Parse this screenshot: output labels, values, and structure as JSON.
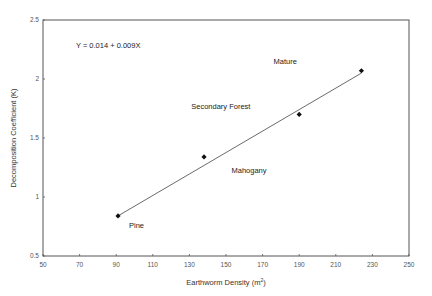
{
  "chart_data": {
    "type": "scatter",
    "title": "",
    "xlabel": "Earthworm Density (m",
    "xlabel_sup": "2",
    "xlabel_suffix": ")",
    "ylabel": "Decomposition Coefficient (K)",
    "xlim": [
      50,
      250
    ],
    "ylim": [
      0.5,
      2.5
    ],
    "xticks": [
      50,
      70,
      90,
      110,
      130,
      150,
      170,
      190,
      210,
      230,
      250
    ],
    "yticks": [
      0.5,
      1,
      1.5,
      2,
      2.5
    ],
    "ytick_labels": [
      "0.5",
      "1",
      "1.5",
      "2",
      "2.5"
    ],
    "grid": false,
    "legend": null,
    "series": [
      {
        "name": "Sites",
        "marker": "diamond",
        "points": [
          {
            "x": 91,
            "y": 0.84,
            "label": "Pine"
          },
          {
            "x": 138,
            "y": 1.34,
            "label": "Mahogany"
          },
          {
            "x": 190,
            "y": 1.7,
            "label": "Secondary Forest"
          },
          {
            "x": 224,
            "y": 2.07,
            "label": "Mature"
          }
        ]
      }
    ],
    "trendline": {
      "equation": "Y = 0.014 + 0.009X",
      "x_start": 91,
      "y_start": 0.84,
      "x_end": 224,
      "y_end": 2.05
    },
    "annotations": [
      {
        "text": "Y = 0.014 + 0.009X",
        "x": 68,
        "y": 2.26
      },
      {
        "text": "Mature",
        "x": 176,
        "y": 2.13
      },
      {
        "text": "Secondary Forest",
        "x": 131,
        "y": 1.75
      },
      {
        "text": "Mahogany",
        "x": 153,
        "y": 1.2
      },
      {
        "text": "Pine",
        "x": 97,
        "y": 0.74
      }
    ]
  },
  "colors": {
    "axis": "#555555",
    "line": "#444444",
    "marker": "#111111",
    "background": "#ffffff"
  }
}
